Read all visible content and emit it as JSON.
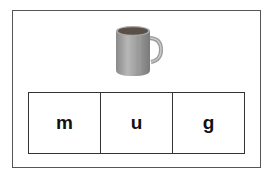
{
  "card": {
    "picture": {
      "icon": "mug-icon",
      "description": "grey mug"
    },
    "letters": [
      {
        "char": "m"
      },
      {
        "char": "u"
      },
      {
        "char": "g"
      }
    ]
  },
  "colors": {
    "border": "#333333",
    "mug_body": "#9a9a9a",
    "mug_highlight": "#cfcfcf"
  }
}
